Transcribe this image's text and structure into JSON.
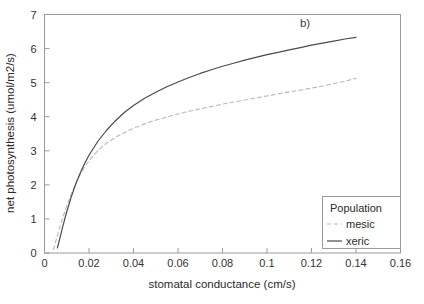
{
  "chart_data": {
    "type": "line",
    "title": "",
    "panel_label": "b)",
    "xlabel": "stomatal conductance (cm/s)",
    "ylabel": "net photosynthesis (umol/m2/s)",
    "xlim": [
      0,
      0.16
    ],
    "ylim": [
      0,
      7
    ],
    "grid": false,
    "legend_position": "lower right (inside axes)",
    "legend_title": "Population",
    "xticks": [
      0,
      0.02,
      0.04,
      0.06,
      0.08,
      0.1,
      0.12,
      0.14,
      0.16
    ],
    "xtick_labels": [
      "0",
      "0.02",
      "0.04",
      "0.06",
      "0.08",
      "0.1",
      "0.12",
      "0.14",
      "0.16"
    ],
    "yticks": [
      0,
      1,
      2,
      3,
      4,
      5,
      6,
      7
    ],
    "ytick_labels": [
      "0",
      "1",
      "2",
      "3",
      "4",
      "5",
      "6",
      "7"
    ],
    "series": [
      {
        "name": "mesic",
        "style": "dashed",
        "color": "#b9b9bd",
        "x": [
          0.004,
          0.005,
          0.006,
          0.007,
          0.008,
          0.01,
          0.012,
          0.014,
          0.016,
          0.018,
          0.02,
          0.024,
          0.028,
          0.032,
          0.036,
          0.04,
          0.045,
          0.05,
          0.055,
          0.06,
          0.065,
          0.07,
          0.075,
          0.08,
          0.085,
          0.09,
          0.095,
          0.1,
          0.105,
          0.11,
          0.115,
          0.12,
          0.125,
          0.13,
          0.135,
          0.14
        ],
        "y": [
          0.1,
          0.33,
          0.56,
          0.78,
          0.99,
          1.38,
          1.73,
          2.03,
          2.3,
          2.52,
          2.71,
          3.01,
          3.23,
          3.4,
          3.54,
          3.66,
          3.79,
          3.9,
          3.99,
          4.08,
          4.16,
          4.23,
          4.3,
          4.37,
          4.43,
          4.49,
          4.55,
          4.61,
          4.67,
          4.73,
          4.78,
          4.84,
          4.9,
          4.97,
          5.04,
          5.13
        ]
      },
      {
        "name": "xeric",
        "style": "solid",
        "color": "#4a4a4f",
        "x": [
          0.0058,
          0.007,
          0.008,
          0.009,
          0.01,
          0.012,
          0.014,
          0.016,
          0.018,
          0.02,
          0.024,
          0.028,
          0.032,
          0.036,
          0.04,
          0.045,
          0.05,
          0.055,
          0.06,
          0.065,
          0.07,
          0.075,
          0.08,
          0.085,
          0.09,
          0.095,
          0.1,
          0.105,
          0.11,
          0.115,
          0.12,
          0.125,
          0.13,
          0.135,
          0.14
        ],
        "y": [
          0.15,
          0.46,
          0.72,
          0.97,
          1.21,
          1.64,
          2.02,
          2.34,
          2.62,
          2.87,
          3.28,
          3.61,
          3.89,
          4.13,
          4.33,
          4.54,
          4.72,
          4.88,
          5.02,
          5.15,
          5.27,
          5.38,
          5.48,
          5.57,
          5.66,
          5.74,
          5.82,
          5.89,
          5.96,
          6.03,
          6.1,
          6.16,
          6.22,
          6.28,
          6.33
        ]
      }
    ]
  },
  "legend": {
    "title": "Population",
    "entries": [
      {
        "label": "mesic",
        "style": "dashed",
        "color": "#b9b9bd"
      },
      {
        "label": "xeric",
        "style": "solid",
        "color": "#4a4a4f"
      }
    ]
  },
  "colors": {
    "background": "#ffffff",
    "axis": "#9a9a9f",
    "text": "#2b2b2b",
    "mesic": "#b9b9bd",
    "xeric": "#4a4a4f"
  }
}
